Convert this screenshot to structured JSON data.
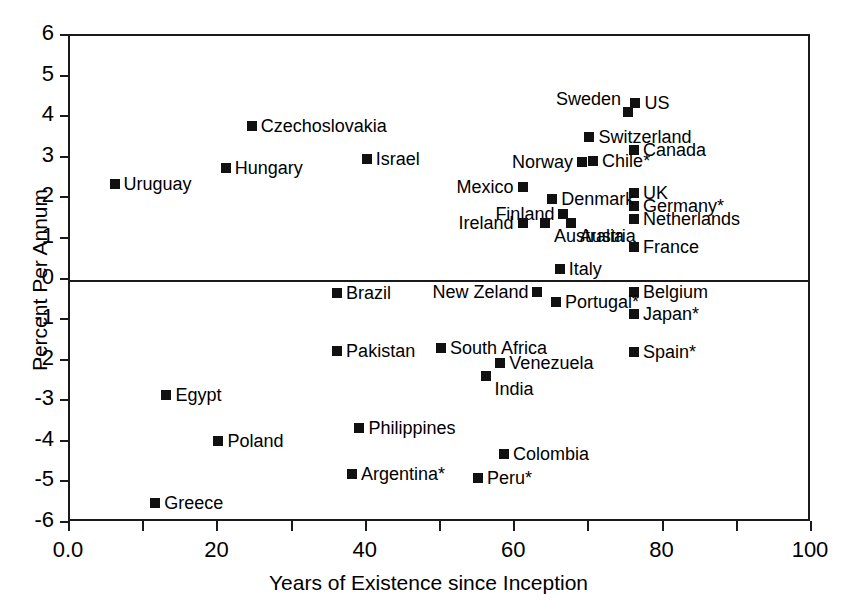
{
  "chart_data": {
    "type": "scatter",
    "title": "",
    "xlabel": "Years of Existence since Inception",
    "ylabel": "Percent Per Annum",
    "xlim": [
      0,
      100
    ],
    "ylim": [
      -6,
      6
    ],
    "xticks": [
      "0.0",
      "20",
      "40",
      "60",
      "80",
      "100"
    ],
    "xtick_values": [
      0,
      20,
      40,
      60,
      80,
      100
    ],
    "xminor_values": [
      10,
      30,
      50,
      70,
      90
    ],
    "yticks": [
      "6",
      "5",
      "4",
      "3",
      "2",
      "1",
      "0",
      "-1",
      "-2",
      "-3",
      "-4",
      "-5",
      "-6"
    ],
    "ytick_values": [
      6,
      5,
      4,
      3,
      2,
      1,
      0,
      -1,
      -2,
      -3,
      -4,
      -5,
      -6
    ],
    "grid": false,
    "legend": "none",
    "zero_reference_line": 0,
    "marker_color": "#111111",
    "axis_color": "#1a1a1a",
    "points": [
      {
        "label": "Uruguay",
        "x": 6,
        "y": 2.35,
        "side": "right"
      },
      {
        "label": "Hungary",
        "x": 21,
        "y": 2.75,
        "side": "right"
      },
      {
        "label": "Czechoslovakia",
        "x": 24.5,
        "y": 3.78,
        "side": "right"
      },
      {
        "label": "Israel",
        "x": 40,
        "y": 2.97,
        "side": "right"
      },
      {
        "label": "Mexico",
        "x": 61,
        "y": 2.28,
        "side": "left"
      },
      {
        "label": "Sweden",
        "x": 75.2,
        "y": 4.12,
        "side": "aboveleft"
      },
      {
        "label": "US",
        "x": 76.2,
        "y": 4.34,
        "side": "right"
      },
      {
        "label": "Switzerland",
        "x": 70,
        "y": 3.5,
        "side": "right"
      },
      {
        "label": "Canada",
        "x": 76,
        "y": 3.18,
        "side": "right"
      },
      {
        "label": "Norway",
        "x": 69,
        "y": 2.9,
        "side": "left"
      },
      {
        "label": "Chile*",
        "x": 70.5,
        "y": 2.92,
        "side": "right"
      },
      {
        "label": "UK",
        "x": 76,
        "y": 2.13,
        "side": "right"
      },
      {
        "label": "Germany*",
        "x": 76,
        "y": 1.8,
        "side": "right"
      },
      {
        "label": "Netherlands",
        "x": 76,
        "y": 1.48,
        "side": "right"
      },
      {
        "label": "France",
        "x": 76,
        "y": 0.8,
        "side": "right"
      },
      {
        "label": "Denmark",
        "x": 65,
        "y": 1.98,
        "side": "right"
      },
      {
        "label": "Finland",
        "x": 66.5,
        "y": 1.62,
        "side": "left"
      },
      {
        "label": "Ireland",
        "x": 61,
        "y": 1.38,
        "side": "left"
      },
      {
        "label": "Australia",
        "x": 64,
        "y": 1.4,
        "side": "below"
      },
      {
        "label": "Austria",
        "x": 67.5,
        "y": 1.4,
        "side": "below"
      },
      {
        "label": "Italy",
        "x": 66,
        "y": 0.25,
        "side": "right"
      },
      {
        "label": "Brazil",
        "x": 36,
        "y": -0.33,
        "side": "right"
      },
      {
        "label": "New Zeland",
        "x": 63,
        "y": -0.32,
        "side": "left"
      },
      {
        "label": "Belgium",
        "x": 76,
        "y": -0.3,
        "side": "right"
      },
      {
        "label": "Portugal*",
        "x": 65.5,
        "y": -0.55,
        "side": "right"
      },
      {
        "label": "Japan*",
        "x": 76,
        "y": -0.85,
        "side": "right"
      },
      {
        "label": "Pakistan",
        "x": 36,
        "y": -1.75,
        "side": "right"
      },
      {
        "label": "South Africa",
        "x": 50,
        "y": -1.68,
        "side": "right"
      },
      {
        "label": "Venezuela",
        "x": 58,
        "y": -2.05,
        "side": "right"
      },
      {
        "label": "Spain*",
        "x": 76,
        "y": -1.78,
        "side": "right"
      },
      {
        "label": "India",
        "x": 56,
        "y": -2.38,
        "side": "below"
      },
      {
        "label": "Egypt",
        "x": 13,
        "y": -2.85,
        "side": "right"
      },
      {
        "label": "Philippines",
        "x": 39,
        "y": -3.65,
        "side": "right"
      },
      {
        "label": "Poland",
        "x": 20,
        "y": -3.97,
        "side": "right"
      },
      {
        "label": "Colombia",
        "x": 58.5,
        "y": -4.3,
        "side": "right"
      },
      {
        "label": "Argentina*",
        "x": 38,
        "y": -4.8,
        "side": "right"
      },
      {
        "label": "Peru*",
        "x": 55,
        "y": -4.88,
        "side": "right"
      },
      {
        "label": "Greece",
        "x": 11.5,
        "y": -5.5,
        "side": "right"
      }
    ]
  }
}
